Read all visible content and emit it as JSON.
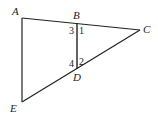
{
  "diagram": {
    "points": {
      "A": {
        "label": "A",
        "x": 22,
        "y": 18
      },
      "B": {
        "label": "B",
        "x": 77,
        "y": 23
      },
      "C": {
        "label": "C",
        "x": 140,
        "y": 30
      },
      "D": {
        "label": "D",
        "x": 77,
        "y": 69
      },
      "E": {
        "label": "E",
        "x": 22,
        "y": 102
      }
    },
    "segments": [
      "AC",
      "AE",
      "EC",
      "BD"
    ],
    "angle_labels": [
      "1",
      "2",
      "3",
      "4"
    ],
    "colors": {
      "stroke": "#222222",
      "background": "#ffffff"
    }
  }
}
